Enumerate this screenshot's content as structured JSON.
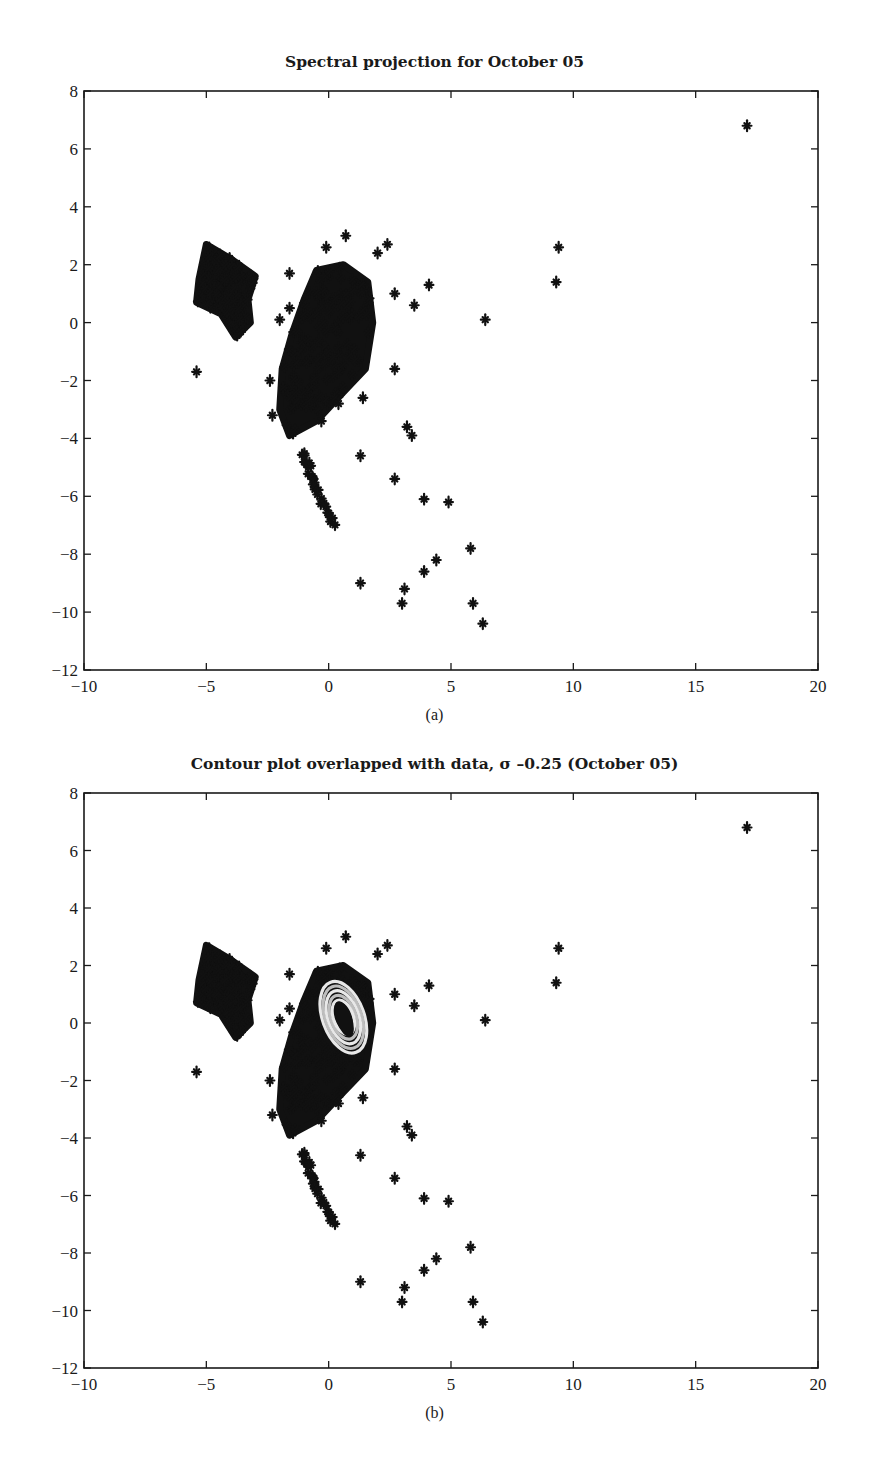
{
  "chart_data": [
    {
      "type": "scatter",
      "id": "a",
      "title": "Spectral projection for October 05",
      "caption": "(a)",
      "xlabel": "",
      "ylabel": "",
      "xlim": [
        -10,
        20
      ],
      "ylim": [
        -12,
        8
      ],
      "xticks": [
        -10,
        -5,
        0,
        5,
        10,
        15,
        20
      ],
      "yticks": [
        8,
        6,
        4,
        2,
        0,
        -2,
        -4,
        -6,
        -8,
        -10,
        -12
      ],
      "grid": false,
      "legend": null,
      "marker": "*",
      "marker_color": "#111111",
      "dense_clusters": [
        {
          "name": "upper-left cluster",
          "polygon": [
            [
              -5.0,
              2.7
            ],
            [
              -4.0,
              2.2
            ],
            [
              -3.0,
              1.6
            ],
            [
              -3.3,
              0.8
            ],
            [
              -3.2,
              0.0
            ],
            [
              -3.8,
              -0.5
            ],
            [
              -4.4,
              0.3
            ],
            [
              -5.4,
              0.7
            ],
            [
              -5.3,
              1.5
            ]
          ],
          "n": 260
        },
        {
          "name": "main cluster",
          "polygon": [
            [
              -0.5,
              1.8
            ],
            [
              0.6,
              2.0
            ],
            [
              1.6,
              1.4
            ],
            [
              1.8,
              0.0
            ],
            [
              1.5,
              -1.6
            ],
            [
              0.6,
              -2.4
            ],
            [
              -0.5,
              -3.4
            ],
            [
              -1.6,
              -3.9
            ],
            [
              -2.0,
              -3.0
            ],
            [
              -1.9,
              -1.6
            ],
            [
              -1.5,
              -0.4
            ],
            [
              -1.0,
              0.8
            ]
          ],
          "n": 900
        },
        {
          "name": "tail streak",
          "line": [
            [
              -1.0,
              -4.5
            ],
            [
              -0.6,
              -5.6
            ],
            [
              0.2,
              -7.0
            ]
          ],
          "n": 28
        }
      ],
      "points": [
        [
          17.1,
          6.8
        ],
        [
          9.4,
          2.6
        ],
        [
          9.3,
          1.4
        ],
        [
          6.4,
          0.1
        ],
        [
          4.1,
          1.3
        ],
        [
          3.5,
          0.6
        ],
        [
          2.7,
          1.0
        ],
        [
          2.4,
          2.7
        ],
        [
          2.0,
          2.4
        ],
        [
          0.7,
          3.0
        ],
        [
          -0.1,
          2.6
        ],
        [
          -1.6,
          1.7
        ],
        [
          -1.6,
          0.5
        ],
        [
          -2.0,
          0.1
        ],
        [
          -5.4,
          -1.7
        ],
        [
          -2.4,
          -2.0
        ],
        [
          -2.3,
          -3.2
        ],
        [
          2.7,
          -1.6
        ],
        [
          1.4,
          -2.6
        ],
        [
          0.4,
          -2.8
        ],
        [
          -0.3,
          -3.4
        ],
        [
          3.2,
          -3.6
        ],
        [
          3.4,
          -3.9
        ],
        [
          1.3,
          -4.6
        ],
        [
          2.7,
          -5.4
        ],
        [
          3.9,
          -6.1
        ],
        [
          4.9,
          -6.2
        ],
        [
          5.8,
          -7.8
        ],
        [
          4.4,
          -8.2
        ],
        [
          3.9,
          -8.6
        ],
        [
          1.3,
          -9.0
        ],
        [
          3.1,
          -9.2
        ],
        [
          3.0,
          -9.7
        ],
        [
          5.9,
          -9.7
        ],
        [
          6.3,
          -10.4
        ]
      ]
    },
    {
      "type": "scatter",
      "id": "b",
      "title": "Contour plot overlapped with data, σ –0.25 (October 05)",
      "caption": "(b)",
      "xlabel": "",
      "ylabel": "",
      "xlim": [
        -10,
        20
      ],
      "ylim": [
        -12,
        8
      ],
      "xticks": [
        -10,
        -5,
        0,
        5,
        10,
        15,
        20
      ],
      "yticks": [
        8,
        6,
        4,
        2,
        0,
        -2,
        -4,
        -6,
        -8,
        -10,
        -12
      ],
      "grid": false,
      "legend": null,
      "marker": "*",
      "marker_color": "#111111",
      "contour": {
        "center": [
          0.6,
          0.2
        ],
        "rx": 0.85,
        "ry": 1.3,
        "rotation_deg": -20,
        "levels": 5,
        "color": "#e8e8e8"
      },
      "dense_clusters": "same as (a)",
      "points": "same as (a)"
    }
  ],
  "figures": {
    "a": {
      "title": "Spectral projection for October 05",
      "caption": "(a)"
    },
    "b": {
      "title": "Contour plot overlapped with data, σ –0.25 (October 05)",
      "caption": "(b)"
    }
  }
}
